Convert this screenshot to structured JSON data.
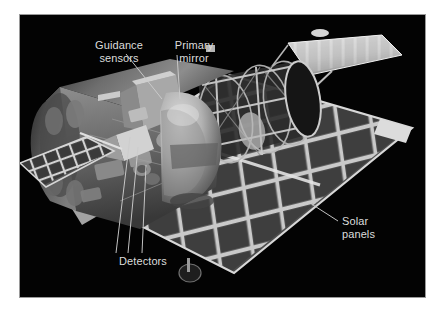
{
  "figure": {
    "kind": "space-telescope-cutaway-diagram",
    "background_color": "#ffffff",
    "plate_color": "#030303",
    "plate_border_color": "#9a9a9a",
    "label_color": "#dcdcdc",
    "leader_line_color": "#c8c8c8"
  },
  "labels": {
    "guidance_sensors": "Guidance\nsensors",
    "primary_mirror": "Primary\nmirror",
    "detectors": "Detectors",
    "solar_panels": "Solar\npanels"
  },
  "parts": {
    "aft_shroud": "aft-shroud-body",
    "instrument_bay": "instrument-bay",
    "primary_mirror_dome": "primary-mirror-dome",
    "truss_rings": "optical-truss-rings",
    "forward_baffle": "forward-baffle-cylinder",
    "solar_array_right": "solar-array-right-wing",
    "solar_array_left": "solar-array-left-wing",
    "high_gain_antenna_upper": "high-gain-antenna-upper",
    "low_gain_antenna_lower": "low-gain-antenna-lower"
  }
}
